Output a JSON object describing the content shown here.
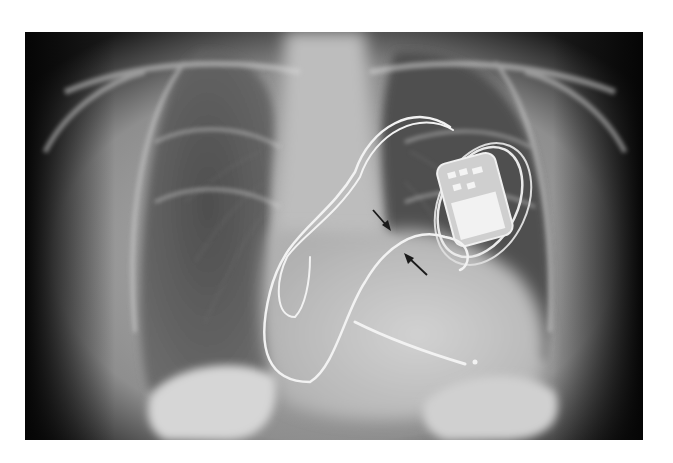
{
  "image": {
    "kind": "chest-radiograph",
    "view": "frontal",
    "frame": {
      "x": 25,
      "y": 32,
      "width": 618,
      "height": 408
    },
    "background_color": "#ffffff"
  },
  "features": {
    "device": "pacemaker-generator",
    "leads": 2,
    "arrows": 2,
    "arrow_color": "#1a1a1a"
  },
  "palette": {
    "edge_dark": "#0a0a0a",
    "soft_tissue": "#9a9a9a",
    "lung": "#4a4a4a",
    "mediastinum": "#c8c8c8",
    "bone": "#d8d8d8",
    "metal": "#f4f4f4"
  }
}
